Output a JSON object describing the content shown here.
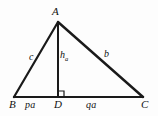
{
  "figure": {
    "background_color": "#fdfdfd",
    "stroke_color": "#1a1a1a",
    "text_color": "#111111",
    "vertices": {
      "A": {
        "label": "A",
        "x": 58,
        "y": 22
      },
      "B": {
        "label": "B",
        "x": 14,
        "y": 97
      },
      "C": {
        "label": "C",
        "x": 143,
        "y": 97
      },
      "D": {
        "label": "D",
        "x": 58,
        "y": 97
      }
    },
    "edges": [
      {
        "name": "side-AB",
        "from": "B",
        "to": "A",
        "label": "c"
      },
      {
        "name": "side-AC",
        "from": "A",
        "to": "C",
        "label": "b"
      },
      {
        "name": "base-BC",
        "from": "B",
        "to": "C",
        "label": ""
      },
      {
        "name": "altitude-AD",
        "from": "A",
        "to": "D",
        "label": "h"
      }
    ],
    "labels": {
      "vertex_a": "A",
      "vertex_b": "B",
      "vertex_c": "C",
      "foot_d": "D",
      "side_c": "c",
      "side_b": "b",
      "altitude": "h",
      "altitude_subscript": "a",
      "segment_bd": "pa",
      "segment_dc": "qa"
    },
    "right_angle": {
      "at": "D",
      "marker": "square",
      "side": "right",
      "size": 6
    }
  }
}
